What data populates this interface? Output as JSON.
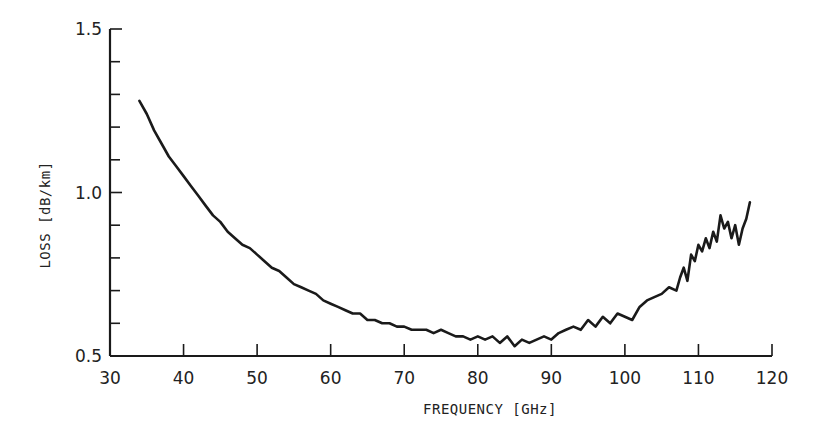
{
  "chart_data": {
    "type": "line",
    "title": "",
    "xlabel": "FREQUENCY [GHz]",
    "ylabel": "LOSS [dB/km]",
    "xlim": [
      30,
      120
    ],
    "ylim": [
      0.5,
      1.5
    ],
    "x_ticks": [
      30,
      40,
      50,
      60,
      70,
      80,
      90,
      100,
      110,
      120
    ],
    "x_tick_labels": [
      "30",
      "40",
      "50",
      "60",
      "70",
      "80",
      "90",
      "100",
      "110",
      "120"
    ],
    "y_ticks": [
      0.5,
      0.6,
      0.7,
      0.8,
      0.9,
      1.0,
      1.1,
      1.2,
      1.3,
      1.4,
      1.5
    ],
    "y_tick_labels": [
      "0.5",
      "1.0",
      "1.5"
    ],
    "grid": false,
    "legend": null,
    "series": [
      {
        "name": "Loss",
        "color": "#1a1a1a",
        "x": [
          34,
          35,
          36,
          37,
          38,
          39,
          40,
          41,
          42,
          43,
          44,
          45,
          46,
          47,
          48,
          49,
          50,
          51,
          52,
          53,
          54,
          55,
          56,
          57,
          58,
          59,
          60,
          61,
          62,
          63,
          64,
          65,
          66,
          67,
          68,
          69,
          70,
          71,
          72,
          73,
          74,
          75,
          76,
          77,
          78,
          79,
          80,
          81,
          82,
          83,
          84,
          85,
          86,
          87,
          88,
          89,
          90,
          91,
          92,
          93,
          94,
          95,
          96,
          97,
          98,
          99,
          100,
          101,
          102,
          103,
          104,
          105,
          106,
          107,
          107.5,
          108,
          108.5,
          109,
          109.5,
          110,
          110.5,
          111,
          111.5,
          112,
          112.5,
          113,
          113.5,
          114,
          114.5,
          115,
          115.5,
          116,
          116.5,
          117
        ],
        "values": [
          1.28,
          1.24,
          1.19,
          1.15,
          1.11,
          1.08,
          1.05,
          1.02,
          0.99,
          0.96,
          0.93,
          0.91,
          0.88,
          0.86,
          0.84,
          0.83,
          0.81,
          0.79,
          0.77,
          0.76,
          0.74,
          0.72,
          0.71,
          0.7,
          0.69,
          0.67,
          0.66,
          0.65,
          0.64,
          0.63,
          0.63,
          0.61,
          0.61,
          0.6,
          0.6,
          0.59,
          0.59,
          0.58,
          0.58,
          0.58,
          0.57,
          0.58,
          0.57,
          0.56,
          0.56,
          0.55,
          0.56,
          0.55,
          0.56,
          0.54,
          0.56,
          0.53,
          0.55,
          0.54,
          0.55,
          0.56,
          0.55,
          0.57,
          0.58,
          0.59,
          0.58,
          0.61,
          0.59,
          0.62,
          0.6,
          0.63,
          0.62,
          0.61,
          0.65,
          0.67,
          0.68,
          0.69,
          0.71,
          0.7,
          0.74,
          0.77,
          0.73,
          0.81,
          0.79,
          0.84,
          0.82,
          0.86,
          0.83,
          0.88,
          0.85,
          0.93,
          0.89,
          0.91,
          0.86,
          0.9,
          0.84,
          0.89,
          0.92,
          0.97
        ]
      }
    ]
  }
}
